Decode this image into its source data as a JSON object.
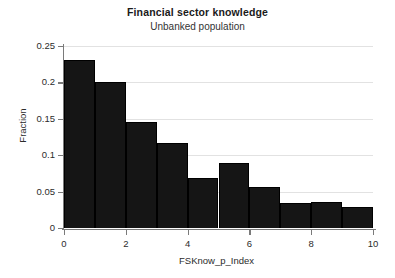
{
  "chart_data": {
    "type": "bar",
    "title": "Financial sector knowledge",
    "subtitle": "Unbanked population",
    "xlabel": "FSKnow_p_Index",
    "ylabel": "Fraction",
    "xlim": [
      0,
      10
    ],
    "ylim": [
      0,
      0.25
    ],
    "grid": true,
    "legend": null,
    "bar_color": "#151515",
    "bin_width": 1,
    "bin_edges": [
      0,
      1,
      2,
      3,
      4,
      5,
      6,
      7,
      8,
      9,
      10
    ],
    "categories": [
      "0-1",
      "1-2",
      "2-3",
      "3-4",
      "4-5",
      "5-6",
      "6-7",
      "7-8",
      "8-9",
      "9-10"
    ],
    "values": [
      0.231,
      0.2,
      0.146,
      0.117,
      0.069,
      0.089,
      0.056,
      0.034,
      0.036,
      0.029
    ],
    "x_ticks": [
      0,
      2,
      4,
      6,
      8,
      10
    ],
    "x_tick_labels": [
      "0",
      "2",
      "4",
      "6",
      "8",
      "10"
    ],
    "y_ticks": [
      0,
      0.05,
      0.1,
      0.15,
      0.2,
      0.25
    ],
    "y_tick_labels": [
      "0",
      "0.05",
      "0.1",
      "0.15",
      "0.2",
      "0.25"
    ]
  }
}
